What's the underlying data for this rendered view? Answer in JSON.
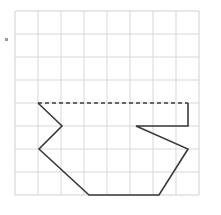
{
  "figure": {
    "canvas": {
      "width": 221,
      "height": 215,
      "background": "#ffffff"
    },
    "colors": {
      "grid_line": "#d7d7d7",
      "grid_border": "#d0d0d0",
      "shape_stroke": "#3a3a3a",
      "dash_stroke": "#3a3a3a",
      "margin_mark": "#9a9a9a"
    },
    "grid": {
      "origin_x": 15,
      "origin_y": 11,
      "cell_size": 23,
      "cols": 8,
      "rows": 8,
      "right": 199,
      "bottom": 195,
      "line_width": 1
    },
    "margin_mark": {
      "label": "bullet",
      "x": 5,
      "y": 38,
      "size": 3
    },
    "shape": {
      "name": "boat-polygon",
      "stroke_width": 1.6,
      "fill": "none",
      "solid_path": "M 38,103 L 62,126 L 39,149 L 89,195 L 159,195 L 188,149 L 136,126 L 188,126 L 188,103",
      "dashed_path": "M 38,103 L 188,103",
      "dash_pattern": "4,3",
      "vertices": [
        {
          "name": "top-left",
          "x": 38,
          "y": 103
        },
        {
          "name": "notch-right",
          "x": 62,
          "y": 126
        },
        {
          "name": "notch-bottom-left",
          "x": 39,
          "y": 149
        },
        {
          "name": "bottom-left",
          "x": 89,
          "y": 195
        },
        {
          "name": "bottom-right",
          "x": 159,
          "y": 195
        },
        {
          "name": "right-point",
          "x": 188,
          "y": 149
        },
        {
          "name": "inner-left",
          "x": 136,
          "y": 126
        },
        {
          "name": "inner-right",
          "x": 188,
          "y": 126
        },
        {
          "name": "top-right",
          "x": 188,
          "y": 103
        }
      ]
    }
  }
}
